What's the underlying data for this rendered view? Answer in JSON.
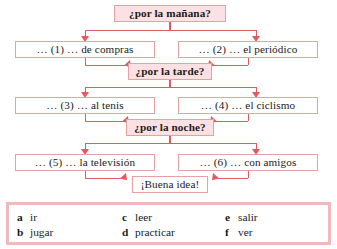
{
  "diagram": {
    "type": "flowchart",
    "title_cutoff": "",
    "nodes": [
      {
        "id": "q1",
        "label": "¿por la mañana?",
        "kind": "question"
      },
      {
        "id": "o1",
        "label": "… (1) … de compras",
        "num": "(1)",
        "lead": "…",
        "tail": "… de compras",
        "kind": "option"
      },
      {
        "id": "o2",
        "label": "… (2) … el periódico",
        "num": "(2)",
        "lead": "…",
        "tail": "… el periódico",
        "kind": "option"
      },
      {
        "id": "q2",
        "label": "¿por la tarde?",
        "kind": "question"
      },
      {
        "id": "o3",
        "label": "… (3) … al tenis",
        "num": "(3)",
        "lead": "…",
        "tail": "… al tenis",
        "kind": "option"
      },
      {
        "id": "o4",
        "label": "… (4) … el ciclismo",
        "num": "(4)",
        "lead": "…",
        "tail": "… el ciclismo",
        "kind": "option"
      },
      {
        "id": "q3",
        "label": "¿por la noche?",
        "kind": "question"
      },
      {
        "id": "o5",
        "label": "… (5) … la televisión",
        "num": "(5)",
        "lead": "…",
        "tail": "… la televisión",
        "kind": "option"
      },
      {
        "id": "o6",
        "label": "… (6) … con amigos",
        "num": "(6)",
        "lead": "…",
        "tail": "… con amigos",
        "kind": "option"
      },
      {
        "id": "end",
        "label": "¡Buena idea!",
        "kind": "terminal"
      }
    ],
    "edges": [
      {
        "from": "q1",
        "to": "o1"
      },
      {
        "from": "q1",
        "to": "o2"
      },
      {
        "from": "o1",
        "to": "q2"
      },
      {
        "from": "o2",
        "to": "q2"
      },
      {
        "from": "q2",
        "to": "o3"
      },
      {
        "from": "q2",
        "to": "o4"
      },
      {
        "from": "o3",
        "to": "q3"
      },
      {
        "from": "o4",
        "to": "q3"
      },
      {
        "from": "q3",
        "to": "o5"
      },
      {
        "from": "q3",
        "to": "o6"
      },
      {
        "from": "o5",
        "to": "end"
      },
      {
        "from": "o6",
        "to": "end"
      }
    ]
  },
  "legend": {
    "items": [
      {
        "key": "a",
        "value": "ir"
      },
      {
        "key": "b",
        "value": "jugar"
      },
      {
        "key": "c",
        "value": "leer"
      },
      {
        "key": "d",
        "value": "practicar"
      },
      {
        "key": "e",
        "value": "salir"
      },
      {
        "key": "f",
        "value": "ver"
      }
    ]
  },
  "colors": {
    "box_fill": "#fbe4e6",
    "box_border": "#e8a0a3",
    "connector": "#e2595e",
    "legend_border": "#f0b9bd",
    "text": "#1b1b1b",
    "page_background": "#ffffff"
  }
}
